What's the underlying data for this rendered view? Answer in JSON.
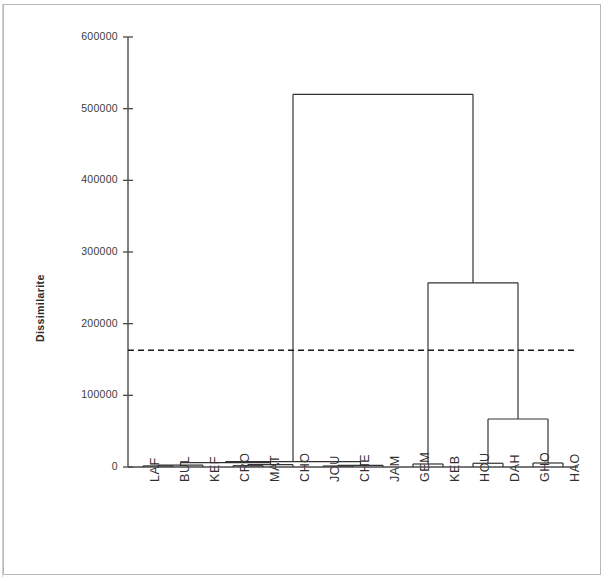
{
  "chart_data": {
    "type": "dendrogram",
    "title": "",
    "subtitle": "",
    "xlabel": "",
    "ylabel": "Dissimilarite",
    "ylim": [
      0,
      600000
    ],
    "ytick_labels": [
      "0",
      "100000",
      "200000",
      "300000",
      "400000",
      "500000",
      "600000"
    ],
    "ytick_values": [
      0,
      100000,
      200000,
      300000,
      400000,
      500000,
      600000
    ],
    "grid": false,
    "legend": "none",
    "line_color": "#333333",
    "axis_color": "#4a4a4a",
    "truncation_line": {
      "value": 163000,
      "style": "dashed",
      "color": "#1a1a1a"
    },
    "leaves": [
      "LAF",
      "BUL",
      "KEF",
      "CRO",
      "MAT",
      "CHO",
      "JOU",
      "CHE",
      "JAM",
      "GEM",
      "KEB",
      "HOU",
      "DAH",
      "GHO",
      "HAO"
    ],
    "leaf_count": 15,
    "merges": [
      {
        "id": "m1",
        "left": "LAF",
        "right": "BUL",
        "height": 1500
      },
      {
        "id": "m2",
        "left": "m1",
        "right": "KEF",
        "height": 2600
      },
      {
        "id": "m3",
        "left": "CRO",
        "right": "MAT",
        "height": 1800
      },
      {
        "id": "m4",
        "left": "m3",
        "right": "CHO",
        "height": 3200
      },
      {
        "id": "m5",
        "left": "JOU",
        "right": "CHE",
        "height": 1400
      },
      {
        "id": "m6",
        "left": "m5",
        "right": "JAM",
        "height": 2400
      },
      {
        "id": "m7",
        "left": "m2",
        "right": "m4",
        "height": 6000
      },
      {
        "id": "m8",
        "left": "m7",
        "right": "m6",
        "height": 7400
      },
      {
        "id": "m9",
        "left": "GEM",
        "right": "KEB",
        "height": 4200
      },
      {
        "id": "m10",
        "left": "HOU",
        "right": "DAH",
        "height": 5200
      },
      {
        "id": "m11",
        "left": "GHO",
        "right": "HAO",
        "height": 5600
      },
      {
        "id": "m12",
        "left": "m10",
        "right": "m11",
        "height": 67000
      },
      {
        "id": "m13",
        "left": "m9",
        "right": "m12",
        "height": 257000
      },
      {
        "id": "m14",
        "left": "m8",
        "right": "m13",
        "height": 520000
      }
    ],
    "root": "m14",
    "clusters_at_cut": 2
  }
}
